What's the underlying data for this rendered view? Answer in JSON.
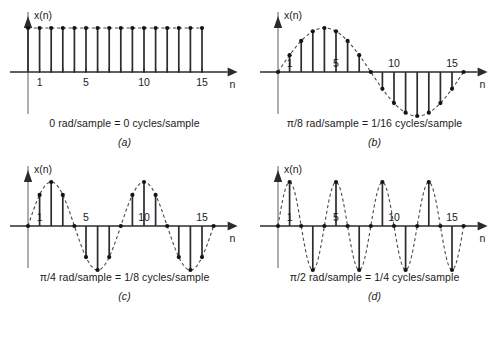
{
  "figure": {
    "background_color": "#ffffff",
    "ink_color": "#2b2b2b",
    "axis_y_color": "#9a9a9a"
  },
  "panels": [
    {
      "id": "a",
      "label": "(a)",
      "caption": "0 rad/sample  =  0 cycles/sample",
      "x_axis_label": "n",
      "y_axis_label": "x(n)",
      "tick_labels": [
        "1",
        "5",
        "10",
        "15"
      ],
      "tick_positions": [
        1,
        5,
        10,
        15
      ]
    },
    {
      "id": "b",
      "label": "(b)",
      "caption": "π/8 rad/sample  =  1/16 cycles/sample",
      "x_axis_label": "n",
      "y_axis_label": "x(n)",
      "tick_labels": [
        "1",
        "5",
        "10",
        "15"
      ],
      "tick_positions": [
        1,
        5,
        10,
        15
      ]
    },
    {
      "id": "c",
      "label": "(c)",
      "caption": "π/4 rad/sample  =  1/8 cycles/sample",
      "x_axis_label": "n",
      "y_axis_label": "x(n)",
      "tick_labels": [
        "1",
        "5",
        "10",
        "15"
      ],
      "tick_positions": [
        1,
        5,
        10,
        15
      ]
    },
    {
      "id": "d",
      "label": "(d)",
      "caption": "π/2 rad/sample  =  1/4 cycles/sample",
      "x_axis_label": "n",
      "y_axis_label": "x(n)",
      "tick_labels": [
        "1",
        "5",
        "10",
        "15"
      ],
      "tick_positions": [
        1,
        5,
        10,
        15
      ]
    }
  ],
  "chart_data": [
    {
      "type": "line",
      "id": "a",
      "title": "0 rad/sample  =  0 cycles/sample",
      "subtitle": "(a)",
      "xlabel": "n",
      "ylabel": "x(n)",
      "xlim": [
        0,
        16
      ],
      "ylim": [
        -1,
        1
      ],
      "grid": false,
      "legend": null,
      "envelope": "constant, value 1 (dashed horizontal line)",
      "x": [
        0,
        1,
        2,
        3,
        4,
        5,
        6,
        7,
        8,
        9,
        10,
        11,
        12,
        13,
        14,
        15
      ],
      "values": [
        1,
        1,
        1,
        1,
        1,
        1,
        1,
        1,
        1,
        1,
        1,
        1,
        1,
        1,
        1,
        1
      ],
      "tick_labels": [
        "1",
        "5",
        "10",
        "15"
      ],
      "tick_positions": [
        1,
        5,
        10,
        15
      ]
    },
    {
      "type": "line",
      "id": "b",
      "title": "π/8 rad/sample  =  1/16 cycles/sample",
      "subtitle": "(b)",
      "xlabel": "n",
      "ylabel": "x(n)",
      "xlim": [
        0,
        16
      ],
      "ylim": [
        -1,
        1
      ],
      "grid": false,
      "legend": null,
      "envelope": "sin(pi*n/8) dashed continuous curve",
      "x": [
        0,
        1,
        2,
        3,
        4,
        5,
        6,
        7,
        8,
        9,
        10,
        11,
        12,
        13,
        14,
        15,
        16
      ],
      "values": [
        0,
        0.383,
        0.707,
        0.924,
        1,
        0.924,
        0.707,
        0.383,
        0,
        -0.383,
        -0.707,
        -0.924,
        -1,
        -0.924,
        -0.707,
        -0.383,
        0
      ],
      "tick_labels": [
        "1",
        "5",
        "10",
        "15"
      ],
      "tick_positions": [
        1,
        5,
        10,
        15
      ]
    },
    {
      "type": "line",
      "id": "c",
      "title": "π/4 rad/sample  =  1/8 cycles/sample",
      "subtitle": "(c)",
      "xlabel": "n",
      "ylabel": "x(n)",
      "xlim": [
        0,
        16
      ],
      "ylim": [
        -1,
        1
      ],
      "grid": false,
      "legend": null,
      "envelope": "sin(pi*n/4) dashed continuous curve",
      "x": [
        0,
        1,
        2,
        3,
        4,
        5,
        6,
        7,
        8,
        9,
        10,
        11,
        12,
        13,
        14,
        15,
        16
      ],
      "values": [
        0,
        0.707,
        1,
        0.707,
        0,
        -0.707,
        -1,
        -0.707,
        0,
        0.707,
        1,
        0.707,
        0,
        -0.707,
        -1,
        -0.707,
        0
      ],
      "tick_labels": [
        "1",
        "5",
        "10",
        "15"
      ],
      "tick_positions": [
        1,
        5,
        10,
        15
      ]
    },
    {
      "type": "line",
      "id": "d",
      "title": "π/2 rad/sample  =  1/4 cycles/sample",
      "subtitle": "(d)",
      "xlabel": "n",
      "ylabel": "x(n)",
      "xlim": [
        0,
        16
      ],
      "ylim": [
        -1,
        1
      ],
      "grid": false,
      "legend": null,
      "envelope": "sin(pi*n/2) dashed continuous curve",
      "x": [
        0,
        1,
        2,
        3,
        4,
        5,
        6,
        7,
        8,
        9,
        10,
        11,
        12,
        13,
        14,
        15,
        16
      ],
      "values": [
        0,
        1,
        0,
        -1,
        0,
        1,
        0,
        -1,
        0,
        1,
        0,
        -1,
        0,
        1,
        0,
        -1,
        0
      ],
      "tick_labels": [
        "1",
        "5",
        "10",
        "15"
      ],
      "tick_positions": [
        1,
        5,
        10,
        15
      ]
    }
  ]
}
